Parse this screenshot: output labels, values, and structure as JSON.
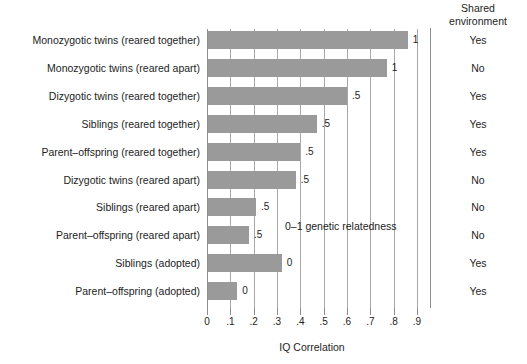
{
  "chart_data": {
    "type": "bar",
    "orientation": "horizontal",
    "title": "",
    "xlabel": "IQ Correlation",
    "ylabel": "",
    "xlim": [
      0,
      0.9
    ],
    "xticks": [
      "0",
      ".1",
      ".2",
      ".3",
      ".4",
      ".5",
      ".6",
      ".7",
      ".8",
      ".9"
    ],
    "xtick_values": [
      0,
      0.1,
      0.2,
      0.3,
      0.4,
      0.5,
      0.6,
      0.7,
      0.8,
      0.9
    ],
    "grid": true,
    "legend": "none",
    "bar_color": "#9a9a9a",
    "annotation": "0–1 genetic relatedness",
    "categories": [
      "Monozygotic twins (reared together)",
      "Monozygotic twins (reared apart)",
      "Dizygotic twins (reared together)",
      "Siblings (reared together)",
      "Parent–offspring (reared together)",
      "Dizygotic twins (reared apart)",
      "Siblings (reared apart)",
      "Parent–offspring (reared apart)",
      "Siblings (adopted)",
      "Parent–offspring (adopted)"
    ],
    "values": [
      0.86,
      0.77,
      0.6,
      0.47,
      0.4,
      0.38,
      0.21,
      0.18,
      0.32,
      0.13
    ],
    "data_labels": [
      "1",
      "1",
      ".5",
      ".5",
      ".5",
      ".5",
      ".5",
      ".5",
      "0",
      "0"
    ],
    "shared_environment": [
      "Yes",
      "No",
      "Yes",
      "Yes",
      "Yes",
      "No",
      "No",
      "No",
      "Yes",
      "Yes"
    ]
  },
  "right_column": {
    "header_line1": "Shared",
    "header_line2": "environment"
  }
}
